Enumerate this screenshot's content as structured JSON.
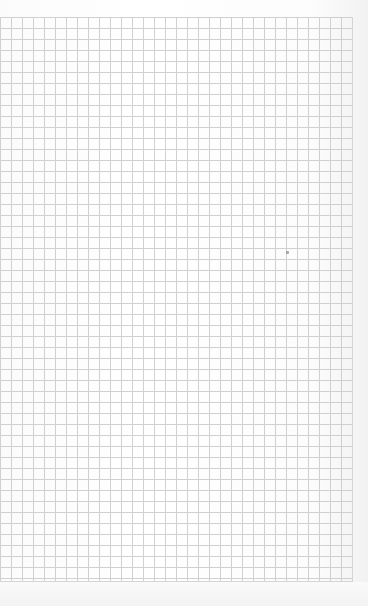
{
  "document": {
    "type": "grid-paper",
    "background_color": "#ffffff",
    "grid_line_color": "#c9c9c9",
    "cell_size_px": 11,
    "columns": 32,
    "rows": 51
  },
  "marks": [
    {
      "name": "speck",
      "x": 286,
      "y": 251
    }
  ]
}
